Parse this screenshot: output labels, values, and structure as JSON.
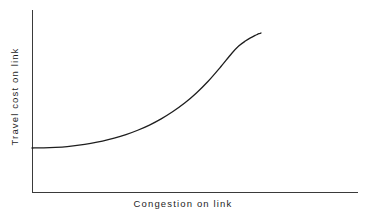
{
  "figure": {
    "name": "link-congestion-cost-curve",
    "background_color": "#ffffff",
    "line_color": "#1e1e1e",
    "axis_color": "#3a3a3a",
    "bleed_text": "........ ...... .. ........"
  },
  "chart_data": {
    "type": "line",
    "title": "",
    "subtitle": "",
    "xlabel": "Congestion on link",
    "ylabel": "Travel cost on link",
    "xticklabels": [],
    "yticklabels": [],
    "grid": false,
    "legend": null,
    "legend_position": "none",
    "annotations": [],
    "xlim": [
      0,
      1
    ],
    "ylim": [
      0,
      1
    ],
    "axis_style": "open-left-bottom-spines",
    "series": [
      {
        "name": "Travel cost vs congestion",
        "description": "Convex link performance function: cost is nearly flat at low congestion then rises asymptotically as the link approaches capacity",
        "line_width": 1.3,
        "color": "#1e1e1e",
        "x": [
          0.0,
          0.05,
          0.1,
          0.15,
          0.2,
          0.25,
          0.3,
          0.35,
          0.4,
          0.45,
          0.5,
          0.55,
          0.6,
          0.65,
          0.7,
          0.75,
          0.8,
          0.85,
          0.88,
          0.91,
          0.93,
          0.95,
          0.96,
          0.97,
          0.975
        ],
        "y": [
          0.271,
          0.272,
          0.275,
          0.28,
          0.288,
          0.299,
          0.313,
          0.331,
          0.353,
          0.38,
          0.412,
          0.45,
          0.495,
          0.547,
          0.609,
          0.681,
          0.764,
          0.852,
          0.898,
          0.93,
          0.948,
          0.963,
          0.97,
          0.975,
          0.978
        ]
      }
    ]
  },
  "geometry": {
    "origin_x": 32,
    "origin_y": 192,
    "y_axis_top": 10,
    "x_axis_right": 358,
    "curve_start": [
      32,
      148
    ],
    "curve_end": [
      261,
      33
    ]
  }
}
